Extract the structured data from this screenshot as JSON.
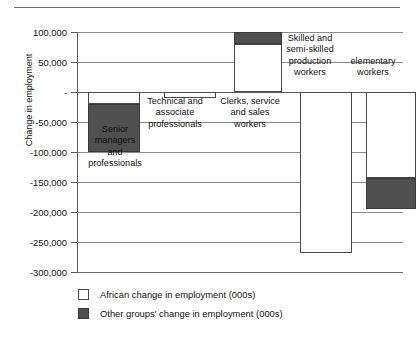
{
  "chart_data": {
    "type": "bar",
    "title": "",
    "subtitle": "",
    "xlabel": "",
    "ylabel": "Change in employment",
    "ylim": [
      -300000,
      100000
    ],
    "ytick_step": 50000,
    "grid": true,
    "stacked": true,
    "legend_position": "bottom-left",
    "ytick_labels": [
      "100,000",
      "50,000",
      "-",
      "-50,000",
      "-100,000",
      "-150,000",
      "-200,000",
      "-250,000",
      "-300,000"
    ],
    "ytick_values": [
      100000,
      50000,
      0,
      -50000,
      -100000,
      -150000,
      -200000,
      -250000,
      -300000
    ],
    "categories": [
      "Senior\nmanagers\nand\nprofessionals",
      "Technical and\nassociate\nprofessionals",
      "Clerks, service\nand sales\nworkers",
      "Skilled and\nsemi-skilled\nproduction\nworkers",
      "elementary\nworkers"
    ],
    "series": [
      {
        "name": "African change in employment (000s)",
        "color": "#ffffff",
        "values": [
          -20000,
          -10000,
          80000,
          -268000,
          -143000
        ]
      },
      {
        "name": "Other groups' change in employment (000s)",
        "color": "#4f4f4f",
        "values": [
          -80000,
          0,
          20000,
          0,
          -52000
        ]
      }
    ],
    "totals": [
      -100000,
      -10000,
      100000,
      -268000,
      -195000
    ]
  },
  "legend": {
    "items": [
      {
        "label": "African change in employment (000s)",
        "swatch": "white-square"
      },
      {
        "label": "Other groups' change in employment (000s)",
        "swatch": "dark-square"
      }
    ]
  },
  "axis": {
    "y_title": "Change in employment"
  },
  "colors": {
    "african": "#ffffff",
    "other": "#4f4f4f",
    "grid": "#8c8c8c",
    "axis": "#5a5a5a",
    "text": "#111111"
  }
}
